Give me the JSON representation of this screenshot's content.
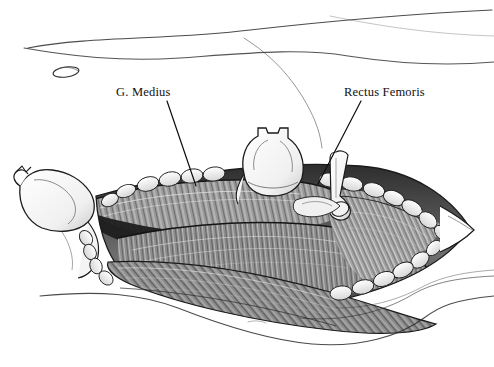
{
  "figure": {
    "kind": "surgical-anatomy-illustration",
    "width": 494,
    "height": 367,
    "background_color": "#ffffff",
    "ink_color": "#1a1a1a",
    "style": "pen-and-ink grayscale medical illustration"
  },
  "labels": [
    {
      "id": "g-medius",
      "text": "G. Medius",
      "x": 116,
      "y": 86,
      "leader": {
        "x1": 167,
        "y1": 101,
        "x2": 196,
        "y2": 186
      }
    },
    {
      "id": "rectus-femoris",
      "text": "Rectus Femoris",
      "x": 344,
      "y": 86,
      "leader": {
        "x1": 361,
        "y1": 101,
        "x2": 318,
        "y2": 184
      }
    }
  ],
  "structures": {
    "skin_contours": [
      {
        "name": "upper-skin-contour-1",
        "d": "M 28 48 C 90 36 170 40 250 30 C 330 21 410 14 492 10"
      },
      {
        "name": "upper-skin-contour-2",
        "d": "M 24 48 C 70 56 120 62 180 58 C 250 53 300 48 348 56 C 400 64 450 66 494 62"
      },
      {
        "name": "upper-skin-contour-3",
        "d": "M 244 38 C 270 54 286 70 300 92 C 312 110 320 128 322 146"
      },
      {
        "name": "lower-skin-contour-1",
        "d": "M 40 296 C 100 290 140 294 178 308 C 224 326 268 340 312 344 C 360 348 400 336 424 318 C 440 306 454 300 494 296"
      },
      {
        "name": "lower-skin-contour-2",
        "d": "M 300 318 C 344 322 382 312 410 296 C 430 284 452 278 494 276"
      },
      {
        "name": "lower-skin-contour-3",
        "d": "M 330 310 C 370 310 400 300 424 288 C 444 278 466 274 494 272"
      }
    ],
    "landmark_oval": {
      "name": "asis-landmark",
      "cx": 66,
      "cy": 72,
      "rx": 13,
      "ry": 5,
      "rotation": -8
    },
    "wound_edges": {
      "name": "wound-fat-lobules",
      "description": "scalloped subcutaneous fat lobules along upper and lower wound margins converging at right apex",
      "apex": {
        "x": 470,
        "y": 228
      }
    },
    "retractors": [
      {
        "name": "left-retractor-blade",
        "x": 14,
        "y": 168,
        "w": 76,
        "h": 62
      },
      {
        "name": "center-retractor-blade",
        "x": 238,
        "y": 128,
        "w": 72,
        "h": 62
      },
      {
        "name": "right-retractor-elevator",
        "x": 312,
        "y": 150,
        "w": 52,
        "h": 62
      }
    ],
    "muscle_masses": [
      {
        "name": "gluteus-medius-belly",
        "note": "upper-left muscle belly, fine longitudinal striations"
      },
      {
        "name": "rectus-femoris-belly",
        "note": "central-right muscle belly beneath retractor"
      },
      {
        "name": "tensor-fascia-lata-belly",
        "note": "lower muscle sweep with dark shadow band"
      }
    ]
  }
}
